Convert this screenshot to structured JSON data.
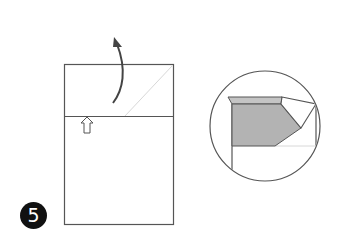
{
  "diagram": {
    "type": "origami-step",
    "step_number": "5",
    "colors": {
      "line": "#555555",
      "paper": "#ffffff",
      "shaded": "#b3b3b3",
      "crease": "#d4d4d4",
      "badge": "#111111"
    },
    "main_view": {
      "sheet": {
        "x": 64,
        "y": 64,
        "w": 109,
        "h": 160
      },
      "fold_line_y": 116,
      "arrow": "curved-fold-up-arrow",
      "push_arrow": "hollow-up-arrow"
    },
    "detail_view": {
      "circle": {
        "cx": 265,
        "cy": 126,
        "r": 55
      }
    }
  }
}
